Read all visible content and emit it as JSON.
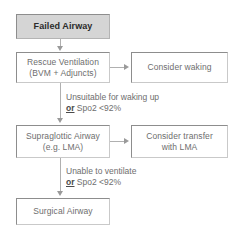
{
  "diagram": {
    "colors": {
      "start_fill": "#d5d5d5",
      "node_fill": "#ffffff",
      "node_border": "#c9c9c9",
      "node_border_dark": "#8d8d8d",
      "text": "#6e6e6e",
      "start_text": "#2b2b2b",
      "connector": "#b0b0b0",
      "arrowhead": "#9a9a9a",
      "background": "#ffffff"
    },
    "nodes": [
      {
        "id": "failed-airway",
        "label": "Failed Airway",
        "label2": ""
      },
      {
        "id": "rescue-ventilation",
        "label": "Rescue Ventilation",
        "label2": "(BVM + Adjuncts)"
      },
      {
        "id": "consider-waking",
        "label": "Consider waking",
        "label2": ""
      },
      {
        "id": "supraglottic-airway",
        "label": "Supraglottic Airway",
        "label2": "(e.g. LMA)"
      },
      {
        "id": "consider-transfer",
        "label": "Consider transfer",
        "label2": "with LMA"
      },
      {
        "id": "surgical-airway",
        "label": "Surgical Airway",
        "label2": ""
      }
    ],
    "edge_labels": [
      {
        "id": "edge-unsuitable",
        "line1": "Unsuitable for waking up",
        "conj": "or",
        "rest": " Spo2 <92%"
      },
      {
        "id": "edge-unable",
        "line1": "Unable to ventilate",
        "conj": "or",
        "rest": " Spo2 <92%"
      }
    ]
  }
}
